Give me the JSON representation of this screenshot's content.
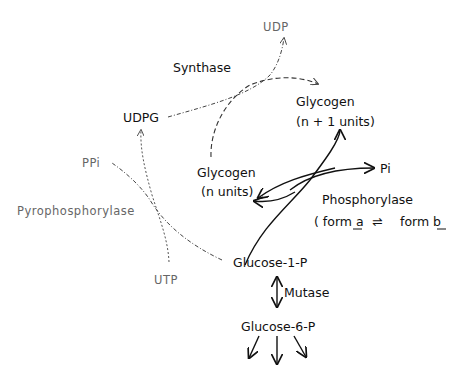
{
  "diagram": {
    "nodes": {
      "udp": "UDP",
      "synthase": "Synthase",
      "udpg": "UDPG",
      "glycogen_n1": "Glycogen",
      "glycogen_n1_units": "(n + 1 units)",
      "glycogen_n": "Glycogen",
      "glycogen_n_units": "(n units)",
      "pi": "Pi",
      "ppi": "PPi",
      "pyrophosphorylase": "Pyrophosphorylase",
      "phosphorylase": "Phosphorylase",
      "phosphorylase_forms": "( form a ⇌ form b",
      "phosphorylase_form_a": "( form a",
      "phosphorylase_equilibrium": "⇌",
      "phosphorylase_form_b": "form b",
      "utp": "UTP",
      "glucose_1_p": "Glucose-1-P",
      "mutase": "Mutase",
      "glucose_6_p": "Glucose-6-P"
    },
    "edges": [
      {
        "from": "UDPG",
        "to": "UDP",
        "style": "dash-dot",
        "enzyme": "Synthase"
      },
      {
        "from": "Glycogen (n units)",
        "to": "Glycogen (n+1 units)",
        "style": "dashed",
        "enzyme": "Synthase"
      },
      {
        "from": "UTP",
        "to": "UDPG",
        "style": "dotted",
        "enzyme": "Pyrophosphorylase"
      },
      {
        "from": "Glucose-1-P",
        "to": "PPi",
        "style": "dash-dot",
        "enzyme": "Pyrophosphorylase"
      },
      {
        "from": "Pi",
        "to": "Glycogen (n+1 units)",
        "style": "solid",
        "enzyme": "Phosphorylase"
      },
      {
        "from": "Glycogen (n+1 units)",
        "to": "Glucose-1-P",
        "style": "solid",
        "enzyme": "Phosphorylase"
      },
      {
        "from": "Glycogen (n+1 units)",
        "to": "Glycogen (n units)",
        "style": "solid",
        "enzyme": "Phosphorylase"
      },
      {
        "from": "Glucose-1-P",
        "to": "Glucose-6-P",
        "style": "solid-bidirectional",
        "enzyme": "Mutase"
      },
      {
        "from": "Glucose-6-P",
        "to": "downstream",
        "style": "solid",
        "count": 3
      }
    ]
  }
}
